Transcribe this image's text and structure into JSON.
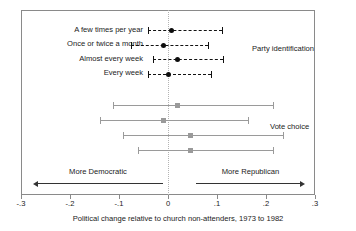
{
  "chart_data": {
    "type": "scatter",
    "title": "",
    "xlabel": "Political change relative to church non-attenders, 1973 to 1982",
    "ylabel": "",
    "xlim": [
      -0.3,
      0.3
    ],
    "xticks": [
      -0.3,
      -0.2,
      -0.1,
      0,
      0.1,
      0.2,
      0.3
    ],
    "xticklabels": [
      "-.3",
      "-.2",
      "-.1",
      "0",
      ".1",
      ".2",
      ".3"
    ],
    "grid": false,
    "reference_line": 0,
    "legend_position": "right-inline",
    "groups": [
      {
        "name": "Party identification",
        "label": "Party identification",
        "style": "dashed",
        "marker": "circle",
        "color": "#111111",
        "points": [
          {
            "category": "A few times per year",
            "estimate": 0.008,
            "ci_low": -0.04,
            "ci_high": 0.11
          },
          {
            "category": "Once or twice a month",
            "estimate": -0.01,
            "ci_low": -0.075,
            "ci_high": 0.082
          },
          {
            "category": "Almost every week",
            "estimate": 0.02,
            "ci_low": -0.03,
            "ci_high": 0.112
          },
          {
            "category": "Every week",
            "estimate": 0.002,
            "ci_low": -0.04,
            "ci_high": 0.088
          }
        ]
      },
      {
        "name": "Vote choice",
        "label": "Vote choice",
        "style": "solid",
        "marker": "square",
        "color": "#9a9a9a",
        "points": [
          {
            "category": "A few times per year",
            "estimate": 0.02,
            "ci_low": -0.112,
            "ci_high": 0.214
          },
          {
            "category": "Once or twice a month",
            "estimate": -0.01,
            "ci_low": -0.139,
            "ci_high": 0.163
          },
          {
            "category": "Almost every week",
            "estimate": 0.045,
            "ci_low": -0.092,
            "ci_high": 0.235
          },
          {
            "category": "Every week",
            "estimate": 0.045,
            "ci_low": -0.061,
            "ci_high": 0.214
          }
        ]
      }
    ],
    "annotations": [
      {
        "text": "More Democratic",
        "direction": "left"
      },
      {
        "text": "More Republican",
        "direction": "right"
      }
    ]
  }
}
